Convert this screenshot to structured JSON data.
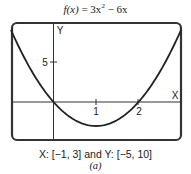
{
  "chart_data": {
    "type": "line",
    "title_parts": {
      "lhs": "f(x)",
      "eq": " = 3x",
      "exp": "2",
      "rest": " − 6x"
    },
    "function": "3x^2 - 6x",
    "xlabel": "X",
    "ylabel": "Y",
    "xlim": [
      -1,
      3
    ],
    "ylim": [
      -5,
      10
    ],
    "x_ticks": [
      1,
      2
    ],
    "x_tick_labels": [
      "1",
      "2"
    ],
    "y_ticks": [
      5
    ],
    "y_tick_labels": [
      "5"
    ],
    "grid": false,
    "series": [
      {
        "name": "f(x)",
        "x": [
          -1,
          -0.5,
          0,
          0.5,
          1,
          1.5,
          2,
          2.5,
          3
        ],
        "y": [
          9,
          3.75,
          0,
          -2.25,
          -3,
          -2.25,
          0,
          3.75,
          9
        ]
      }
    ],
    "caption": "X: [−1, 3] and Y: [−5, 10]",
    "sublabel": "(a)"
  }
}
